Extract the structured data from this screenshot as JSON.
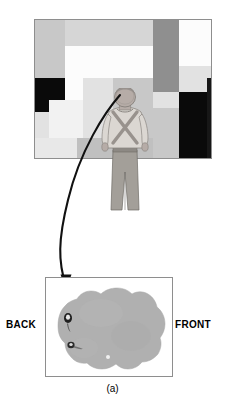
{
  "figure": {
    "caption": "(a)",
    "background_color": "#ffffff"
  },
  "top_panel": {
    "name": "mondrian-display-panel",
    "border_color": "#8e8e8e",
    "x": 34,
    "y": 19,
    "width": 178,
    "height": 140,
    "description": "Grayscale Mondrian mosaic pattern display",
    "tiles": [
      {
        "id": "tile-1",
        "x": 0,
        "y": 0,
        "w": 30,
        "h": 58,
        "color": "#c8c8c8"
      },
      {
        "id": "tile-2",
        "x": 30,
        "y": 0,
        "w": 47,
        "h": 26,
        "color": "#d6d6d6"
      },
      {
        "id": "tile-3",
        "x": 77,
        "y": 0,
        "w": 41,
        "h": 26,
        "color": "#d6d6d6"
      },
      {
        "id": "tile-4",
        "x": 30,
        "y": 26,
        "w": 48,
        "h": 32,
        "color": "#fcfcfc"
      },
      {
        "id": "tile-5",
        "x": 78,
        "y": 26,
        "w": 40,
        "h": 32,
        "color": "#fcfcfc"
      },
      {
        "id": "tile-6",
        "x": 0,
        "y": 58,
        "w": 30,
        "h": 34,
        "color": "#0a0a0a"
      },
      {
        "id": "tile-7",
        "x": 30,
        "y": 58,
        "w": 18,
        "h": 22,
        "color": "#fcfcfc"
      },
      {
        "id": "tile-8",
        "x": 48,
        "y": 58,
        "w": 30,
        "h": 22,
        "color": "#e2e2e2"
      },
      {
        "id": "tile-9",
        "x": 118,
        "y": 0,
        "w": 26,
        "h": 72,
        "color": "#8f8f8f"
      },
      {
        "id": "tile-10",
        "x": 144,
        "y": 0,
        "w": 46,
        "h": 26,
        "color": "#fcfcfc"
      },
      {
        "id": "tile-11",
        "x": 190,
        "y": 0,
        "w": 18,
        "h": 46,
        "color": "#8f8f8f"
      },
      {
        "id": "tile-12",
        "x": 144,
        "y": 26,
        "w": 46,
        "h": 20,
        "color": "#fcfcfc"
      },
      {
        "id": "tile-13",
        "x": 144,
        "y": 46,
        "w": 64,
        "h": 26,
        "color": "#e2e2e2"
      },
      {
        "id": "tile-14",
        "x": 118,
        "y": 72,
        "w": 26,
        "h": 16,
        "color": "#e2e2e2"
      },
      {
        "id": "tile-15",
        "x": 0,
        "y": 92,
        "w": 14,
        "h": 26,
        "color": "#e2e2e2"
      },
      {
        "id": "tile-16",
        "x": 14,
        "y": 80,
        "w": 34,
        "h": 38,
        "color": "#f2f2f2"
      },
      {
        "id": "tile-17",
        "x": 48,
        "y": 80,
        "w": 30,
        "h": 38,
        "color": "#e2e2e2"
      },
      {
        "id": "tile-18",
        "x": 78,
        "y": 58,
        "w": 40,
        "h": 60,
        "color": "#c8c8c8"
      },
      {
        "id": "tile-19",
        "x": 0,
        "y": 118,
        "w": 42,
        "h": 22,
        "color": "#e8e8e8"
      },
      {
        "id": "tile-20",
        "x": 42,
        "y": 118,
        "w": 76,
        "h": 22,
        "color": "#c0c0c0"
      },
      {
        "id": "tile-21",
        "x": 118,
        "y": 88,
        "w": 26,
        "h": 52,
        "color": "#c8c8c8"
      },
      {
        "id": "tile-22",
        "x": 144,
        "y": 72,
        "w": 28,
        "h": 68,
        "color": "#0a0a0a"
      },
      {
        "id": "tile-23",
        "x": 172,
        "y": 58,
        "w": 36,
        "h": 82,
        "color": "#171717"
      },
      {
        "id": "tile-24",
        "x": 190,
        "y": 46,
        "w": 18,
        "h": 12,
        "color": "#8f8f8f"
      }
    ]
  },
  "person": {
    "name": "observer-figure",
    "description": "Person seen from behind wearing crossed suspenders, facing the mosaic display",
    "x": 96,
    "y": 88,
    "width": 58,
    "height": 124,
    "skin_color": "#b4aaa6",
    "shirt_color": "#d8d4cf",
    "trouser_color": "#a8a49e",
    "suspender_color": "#9a9490"
  },
  "arrow": {
    "name": "pointer-arrow",
    "color": "#111111",
    "description": "Curved arrow from observer's head down to the blot panel",
    "from": "observer head",
    "to": "blot panel upper-left region"
  },
  "bottom_panel": {
    "name": "receptive-field-panel",
    "border_color": "#8e8e8e",
    "x": 45,
    "y": 277,
    "width": 128,
    "height": 100,
    "blob_color": "#b0b0b0",
    "description": "Irregular gray blob representing the visual field region",
    "spots": [
      {
        "id": "spot-1",
        "cx": 22,
        "cy": 40,
        "rx": 4.0,
        "ry": 5.0,
        "color": "#1f1f1f"
      },
      {
        "id": "spot-2",
        "cx": 25,
        "cy": 67,
        "rx": 3.5,
        "ry": 3.2,
        "color": "#2a2a2a"
      },
      {
        "id": "spot-3",
        "cx": 62,
        "cy": 79,
        "rx": 2.0,
        "ry": 2.0,
        "color": "#f0f0f0"
      }
    ]
  },
  "labels": {
    "back": "BACK",
    "front": "FRONT"
  }
}
